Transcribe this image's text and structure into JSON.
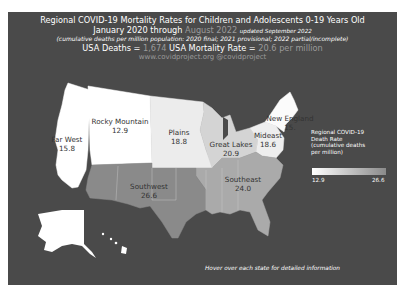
{
  "header": {
    "title": "Regional COVID-19 Mortality Rates for Children and Adolescents 0-19 Years Old",
    "period_prefix": "January 2020 through",
    "period_end": "August 2022",
    "updated": "updated September 2022",
    "subtitle": "(cumulative deaths per million population: 2020 final; 2021 provisional; 2022 partial/incomplete)",
    "deaths_label": "USA Deaths =",
    "deaths_value": "1,674",
    "rate_label": "USA Mortality Rate =",
    "rate_value": "20.6 per million",
    "credits": "www.covidproject.org  @covidproject"
  },
  "regions": [
    {
      "name": "Far West",
      "value": "15.8",
      "color": "#ffffff"
    },
    {
      "name": "Rocky Mountain",
      "value": "12.9",
      "color": "#ffffff"
    },
    {
      "name": "Plains",
      "value": "18.8",
      "color": "#ececec"
    },
    {
      "name": "Great Lakes",
      "value": "20.9",
      "color": "#d4d4d4"
    },
    {
      "name": "Mideast",
      "value": "18.6",
      "color": "#eeeeee"
    },
    {
      "name": "New England",
      "value": "15.",
      "color": "#fbfbfb"
    },
    {
      "name": "Southeast",
      "value": "24.0",
      "color": "#aaaaaa"
    },
    {
      "name": "Southwest",
      "value": "26.6",
      "color": "#8a8a8a"
    }
  ],
  "legend": {
    "title_lines": [
      "Regional COVID-19",
      "Death Rate",
      "(cumulative deaths",
      "per million)"
    ],
    "min": "12.9",
    "max": "26.6",
    "color_min": "#ffffff",
    "color_max": "#8a8a8a"
  },
  "footer": {
    "hint": "Hover over each state for detailed information"
  },
  "colors": {
    "background": "#4a4a4a",
    "text": "#ffffff",
    "muted_text": "#9a9a9a"
  }
}
